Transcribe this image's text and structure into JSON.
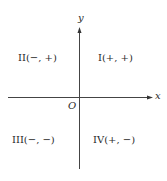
{
  "diagram": {
    "type": "coordinate-plane-quadrants",
    "axes": {
      "x_label": "x",
      "y_label": "y",
      "origin_label": "O"
    },
    "quadrants": [
      {
        "id": "I",
        "label": "I(+, +)",
        "sign_x": "+",
        "sign_y": "+"
      },
      {
        "id": "II",
        "label": "II(−, +)",
        "sign_x": "−",
        "sign_y": "+"
      },
      {
        "id": "III",
        "label": "III(−, −)",
        "sign_x": "−",
        "sign_y": "−"
      },
      {
        "id": "IV",
        "label": "IV(+, −)",
        "sign_x": "+",
        "sign_y": "−"
      }
    ],
    "colors": {
      "axis": "#444444",
      "text": "#2a2a2a",
      "background": "#ffffff"
    }
  }
}
